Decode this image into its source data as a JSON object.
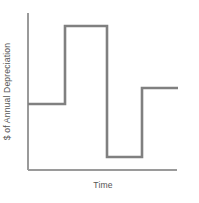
{
  "chart_data": {
    "type": "line",
    "subtype": "step",
    "title": "",
    "subtitle": "",
    "xlabel": "Time",
    "ylabel": "$ of Annual Depreciation",
    "grid": false,
    "legend": "none",
    "x_tick_labels": [],
    "y_tick_labels": [],
    "xlim": [
      0,
      4
    ],
    "ylim": [
      0,
      5
    ],
    "axes": {
      "y_axis": {
        "x": 28,
        "y_top": 13,
        "y_bottom": 170
      },
      "x_axis": {
        "y": 170,
        "x_left": 28,
        "x_right": 177
      }
    },
    "series": [
      {
        "name": "Annual Depreciation",
        "style": "step",
        "color": "#808080",
        "line_width": 2.6,
        "steps": [
          {
            "label": "Period 1",
            "x_start": 0,
            "x_end": 1,
            "value": 2.1,
            "px": {
              "x_start": 28,
              "x_end": 65,
              "y": 104
            }
          },
          {
            "label": "Period 2",
            "x_start": 1,
            "x_end": 2,
            "value": 4.1,
            "px": {
              "x_start": 65,
              "x_end": 107,
              "y": 26
            }
          },
          {
            "label": "Period 3",
            "x_start": 2,
            "x_end": 3,
            "value": 0.75,
            "px": {
              "x_start": 107,
              "x_end": 142,
              "y": 157
            }
          },
          {
            "label": "Period 4",
            "x_start": 3,
            "x_end": 4,
            "value": 2.55,
            "px": {
              "x_start": 142,
              "x_end": 178,
              "y": 88
            }
          }
        ],
        "categories": [
          "Period 1",
          "Period 2",
          "Period 3",
          "Period 4"
        ],
        "values": [
          2.1,
          4.1,
          0.75,
          2.55
        ]
      }
    ],
    "path_points": [
      [
        28,
        104
      ],
      [
        65,
        104
      ],
      [
        65,
        26
      ],
      [
        107,
        26
      ],
      [
        107,
        157
      ],
      [
        142,
        157
      ],
      [
        142,
        88
      ],
      [
        178,
        88
      ]
    ]
  },
  "colors": {
    "background": "#ffffff",
    "step_line": "#808080",
    "axis_line": "#9a9a9a",
    "label_text": "#555555"
  },
  "labels": {
    "y_axis": "$ of Annual Depreciation",
    "x_axis": "Time"
  }
}
